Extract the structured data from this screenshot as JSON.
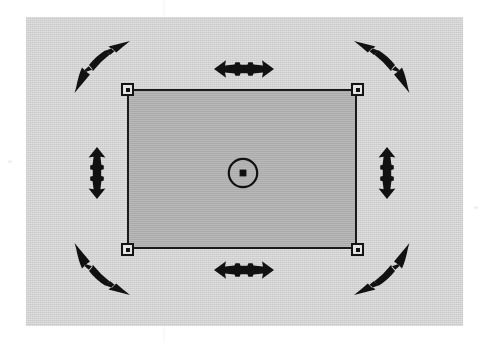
{
  "figure": {
    "colors": {
      "page_background": "#ffffff",
      "canvas_panel": "#d2d2d2",
      "object_fill": "#ababab",
      "ink": "#111111",
      "handle_fill": "#e4e4e4"
    }
  },
  "canvas": {
    "name": "canvas-panel",
    "x": 26,
    "y": 17,
    "width": 437,
    "height": 309
  },
  "object": {
    "name": "selected-rectangle",
    "x": 127,
    "y": 89,
    "width": 230,
    "height": 160,
    "fill": "#ababab",
    "stroke": "#1a1a1a",
    "stroke_width": 2,
    "selected": true
  },
  "handles": {
    "corners": [
      {
        "id": "handle-top-left",
        "label": "Top-left resize handle",
        "x": 121,
        "y": 83
      },
      {
        "id": "handle-top-right",
        "label": "Top-right resize handle",
        "x": 351,
        "y": 83
      },
      {
        "id": "handle-bottom-left",
        "label": "Bottom-left resize handle",
        "x": 121,
        "y": 243
      },
      {
        "id": "handle-bottom-right",
        "label": "Bottom-right resize handle",
        "x": 351,
        "y": 243
      }
    ],
    "center": {
      "id": "center-anchor",
      "label": "Center anchor point",
      "x": 243,
      "y": 173,
      "circle_radius": 15,
      "square_size": 7
    }
  },
  "arrows": {
    "top": {
      "id": "arrow-top",
      "icon": "double-arrow-horizontal-icon",
      "label": "Horizontal stretch arrow (top edge)",
      "direction": "horizontal",
      "heads": 2
    },
    "bottom": {
      "id": "arrow-bottom",
      "icon": "double-arrow-horizontal-icon",
      "label": "Horizontal stretch arrow (bottom edge)",
      "direction": "horizontal",
      "heads": 2
    },
    "left": {
      "id": "arrow-left",
      "icon": "double-arrow-vertical-icon",
      "label": "Vertical stretch arrow (left edge)",
      "direction": "vertical",
      "heads": 2
    },
    "right": {
      "id": "arrow-right",
      "icon": "double-arrow-vertical-icon",
      "label": "Vertical stretch arrow (right edge)",
      "direction": "vertical",
      "heads": 2
    },
    "top_left": {
      "id": "arrow-top-left",
      "icon": "double-arrow-diagonal-nesw-icon",
      "label": "Diagonal rotate arrow (top-left corner)",
      "direction": "northeast-southwest",
      "heads": 2
    },
    "top_right": {
      "id": "arrow-top-right",
      "icon": "double-arrow-diagonal-nwse-icon",
      "label": "Diagonal rotate arrow (top-right corner)",
      "direction": "northwest-southeast",
      "heads": 2
    },
    "bottom_left": {
      "id": "arrow-bottom-left",
      "icon": "double-arrow-diagonal-nwse-icon",
      "label": "Diagonal rotate arrow (bottom-left corner)",
      "direction": "northwest-southeast",
      "heads": 2
    },
    "bottom_right": {
      "id": "arrow-bottom-right",
      "icon": "double-arrow-diagonal-nesw-icon",
      "label": "Diagonal rotate arrow (bottom-right corner)",
      "direction": "northeast-southwest",
      "heads": 2
    }
  }
}
